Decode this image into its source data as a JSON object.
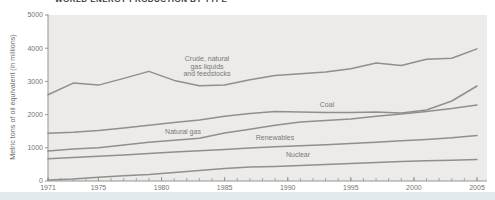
{
  "chart_data": {
    "type": "line",
    "title": "WORLD ENERGY PRODUCTION BY TYPE",
    "ylabel": "Metric tons of oil equivalent (in millions)",
    "xlabel": "",
    "xlim": [
      1971,
      2005
    ],
    "ylim": [
      0,
      5000
    ],
    "x_ticks": [
      1971,
      1975,
      1980,
      1985,
      1990,
      1995,
      2000,
      2005
    ],
    "y_ticks": [
      0,
      1000,
      2000,
      3000,
      4000,
      5000
    ],
    "minor_x_ticks_every_year": true,
    "grid": false,
    "legend": "inline-labels",
    "x": [
      1971,
      1973,
      1975,
      1977,
      1979,
      1981,
      1983,
      1985,
      1987,
      1989,
      1991,
      1993,
      1995,
      1997,
      1999,
      2001,
      2003,
      2005
    ],
    "series": [
      {
        "name": "Crude, natural gas liquids and feedstocks",
        "label_lines": [
          "Crude, natural",
          "gas liquids",
          "and feedstocks"
        ],
        "values": [
          2600,
          2950,
          2890,
          3090,
          3300,
          3030,
          2870,
          2890,
          3050,
          3180,
          3230,
          3280,
          3380,
          3550,
          3480,
          3670,
          3700,
          3980
        ]
      },
      {
        "name": "Coal",
        "label_lines": [
          "Coal"
        ],
        "values": [
          1440,
          1470,
          1520,
          1600,
          1680,
          1760,
          1840,
          1950,
          2030,
          2090,
          2080,
          2060,
          2060,
          2080,
          2050,
          2140,
          2410,
          2860
        ]
      },
      {
        "name": "Natural gas",
        "label_lines": [
          "Natural gas"
        ],
        "values": [
          900,
          960,
          1000,
          1080,
          1170,
          1230,
          1290,
          1450,
          1560,
          1680,
          1780,
          1820,
          1870,
          1950,
          2020,
          2090,
          2180,
          2290
        ]
      },
      {
        "name": "Renewables",
        "label_lines": [
          "Renewables"
        ],
        "values": [
          670,
          710,
          745,
          785,
          830,
          870,
          910,
          950,
          990,
          1030,
          1060,
          1090,
          1130,
          1170,
          1210,
          1250,
          1300,
          1370
        ]
      },
      {
        "name": "Nuclear",
        "label_lines": [
          "Nuclear"
        ],
        "values": [
          30,
          60,
          110,
          160,
          200,
          260,
          320,
          380,
          420,
          440,
          465,
          500,
          525,
          560,
          590,
          610,
          625,
          650
        ]
      }
    ],
    "colors": {
      "line": "#908f8b",
      "plot_background": "#ecebe9",
      "axis": "#97958f",
      "tick_label": "#76746f",
      "series_label": "#7a7974",
      "title": "#3a3a38",
      "footer_strip": "#e2eaee"
    }
  }
}
